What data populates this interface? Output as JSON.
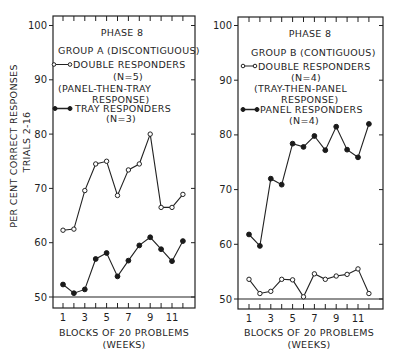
{
  "figure": {
    "ylabel_line1": "PER CENT CORRECT RESPONSES",
    "ylabel_line2": "TRIALS 2-16"
  },
  "left_panel": {
    "title": "PHASE 8",
    "group": "GROUP A (DISCONTIGUOUS)",
    "legend_open": "DOUBLE RESPONDERS",
    "legend_open_n": "(N=5)",
    "legend_open_note1": "(PANEL-THEN-TRAY",
    "legend_open_note2": "RESPONSE)",
    "legend_filled": "TRAY RESPONDERS",
    "legend_filled_n": "(N=3)",
    "xlabel": "BLOCKS OF 20 PROBLEMS",
    "xlabel_sub": "(WEEKS)"
  },
  "right_panel": {
    "title": "PHASE 8",
    "group": "GROUP B (CONTIGUOUS)",
    "legend_open": "DOUBLE RESPONDERS",
    "legend_open_n": "(N=4)",
    "legend_open_note1": "(TRAY-THEN-PANEL",
    "legend_open_note2": "RESPONSE)",
    "legend_filled": "PANEL RESPONDERS",
    "legend_filled_n": "(N=4)",
    "xlabel": "BLOCKS OF 20 PROBLEMS",
    "xlabel_sub": "(WEEKS)"
  },
  "chart_data": [
    {
      "type": "line",
      "title": "PHASE 8 — GROUP A (DISCONTIGUOUS)",
      "xlabel": "BLOCKS OF 20 PROBLEMS (WEEKS)",
      "ylabel": "PER CENT CORRECT RESPONSES TRIALS 2-16",
      "x": [
        1,
        2,
        3,
        4,
        5,
        6,
        7,
        8,
        9,
        10,
        11,
        12
      ],
      "x_tick_labels": [
        "1",
        "3",
        "5",
        "7",
        "9",
        "11"
      ],
      "y_tick_labels": [
        "50",
        "60",
        "70",
        "80",
        "90",
        "100"
      ],
      "ylim": [
        50,
        100
      ],
      "grid": false,
      "legend_position": "upper-left inside",
      "series": [
        {
          "name": "DOUBLE RESPONDERS (N=5) (PANEL-THEN-TRAY RESPONSE)",
          "marker": "open-circle",
          "values": [
            62.3,
            62.5,
            69.6,
            74.5,
            75.0,
            68.7,
            73.4,
            74.5,
            80.0,
            66.5,
            66.5,
            68.9
          ]
        },
        {
          "name": "TRAY RESPONDERS (N=3)",
          "marker": "filled-circle",
          "values": [
            52.3,
            50.7,
            51.4,
            57.0,
            58.1,
            53.8,
            56.7,
            59.5,
            61.0,
            58.8,
            56.6,
            60.3
          ]
        }
      ]
    },
    {
      "type": "line",
      "title": "PHASE 8 — GROUP B (CONTIGUOUS)",
      "xlabel": "BLOCKS OF 20 PROBLEMS (WEEKS)",
      "ylabel": "PER CENT CORRECT RESPONSES TRIALS 2-16",
      "x": [
        1,
        2,
        3,
        4,
        5,
        6,
        7,
        8,
        9,
        10,
        11,
        12
      ],
      "x_tick_labels": [
        "1",
        "3",
        "5",
        "7",
        "9",
        "11"
      ],
      "y_tick_labels": [
        "50",
        "60",
        "70",
        "80",
        "90",
        "100"
      ],
      "ylim": [
        50,
        100
      ],
      "grid": false,
      "legend_position": "upper-left inside",
      "series": [
        {
          "name": "DOUBLE RESPONDERS (N=4) (TRAY-THEN-PANEL RESPONSE)",
          "marker": "open-circle",
          "values": [
            53.6,
            51.0,
            51.4,
            53.6,
            53.5,
            50.4,
            54.6,
            53.6,
            54.2,
            54.5,
            55.5,
            51.0
          ]
        },
        {
          "name": "PANEL RESPONDERS (N=4)",
          "marker": "filled-circle",
          "values": [
            61.8,
            59.7,
            72.0,
            70.9,
            78.4,
            77.8,
            79.8,
            77.2,
            81.5,
            77.3,
            75.9,
            82.0
          ]
        }
      ]
    }
  ]
}
